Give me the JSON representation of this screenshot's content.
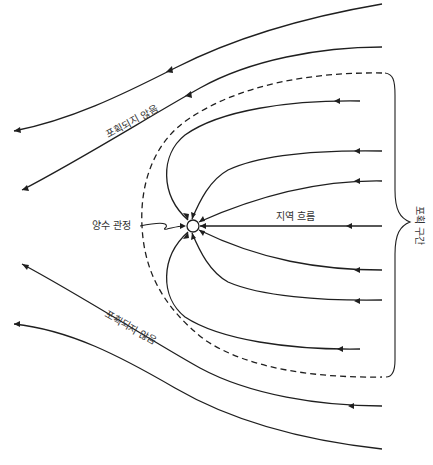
{
  "diagram": {
    "labels": {
      "not_captured_upper": "포획되지 않음",
      "not_captured_lower": "포획되지 않음",
      "pumping_well": "양수 관정",
      "regional_flow": "지역 흐름",
      "capture_zone": "포획 구간"
    },
    "elements": {
      "captured_streamlines": 7,
      "uncaptured_streamlines": 4,
      "capture_zone_boundary": "dashed",
      "flow_direction": "right-to-left"
    },
    "colors": {
      "line": "#1f1f1f",
      "text": "#333333",
      "background": "#ffffff"
    }
  }
}
